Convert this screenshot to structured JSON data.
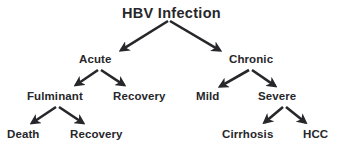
{
  "diagram": {
    "title": "HBV Infection",
    "type": "tree-flowchart",
    "colors": {
      "background": "#ffffff",
      "text": "#27272b",
      "arrow": "#27272b"
    },
    "nodes": [
      {
        "id": "root",
        "label": "HBV  Infection",
        "level": 0,
        "x": 122,
        "y": 6,
        "font_size": 14.5
      },
      {
        "id": "acute",
        "label": "Acute",
        "level": 1,
        "x": 79,
        "y": 54,
        "font_size": 11.5
      },
      {
        "id": "chronic",
        "label": "Chronic",
        "level": 1,
        "x": 229,
        "y": 54,
        "font_size": 11.5
      },
      {
        "id": "fulminant",
        "label": "Fulminant",
        "level": 2,
        "x": 27,
        "y": 91,
        "font_size": 11.5
      },
      {
        "id": "recovery-a",
        "label": "Recovery",
        "level": 2,
        "x": 113,
        "y": 91,
        "font_size": 11.5
      },
      {
        "id": "mild",
        "label": "Mild",
        "level": 2,
        "x": 196,
        "y": 91,
        "font_size": 11.5
      },
      {
        "id": "severe",
        "label": "Severe",
        "level": 2,
        "x": 258,
        "y": 91,
        "font_size": 11.5
      },
      {
        "id": "death",
        "label": "Death",
        "level": 3,
        "x": 7,
        "y": 129,
        "font_size": 11.5
      },
      {
        "id": "recovery-f",
        "label": "Recovery",
        "level": 3,
        "x": 70,
        "y": 129,
        "font_size": 11.5
      },
      {
        "id": "cirrhosis",
        "label": "Cirrhosis",
        "level": 3,
        "x": 222,
        "y": 129,
        "font_size": 11.5
      },
      {
        "id": "hcc",
        "label": "HCC",
        "level": 3,
        "x": 303,
        "y": 129,
        "font_size": 11.5
      }
    ],
    "edges": [
      {
        "from": "root",
        "to": "acute",
        "x1": 168,
        "y1": 21,
        "x2": 115,
        "y2": 54
      },
      {
        "from": "root",
        "to": "chronic",
        "x1": 170,
        "y1": 21,
        "x2": 226,
        "y2": 54
      },
      {
        "from": "acute",
        "to": "fulminant",
        "x1": 98,
        "y1": 70,
        "x2": 70,
        "y2": 89
      },
      {
        "from": "acute",
        "to": "recovery-a",
        "x1": 101,
        "y1": 70,
        "x2": 130,
        "y2": 89
      },
      {
        "from": "chronic",
        "to": "mild",
        "x1": 249,
        "y1": 70,
        "x2": 214,
        "y2": 90
      },
      {
        "from": "chronic",
        "to": "severe",
        "x1": 252,
        "y1": 70,
        "x2": 281,
        "y2": 90
      },
      {
        "from": "fulminant",
        "to": "death",
        "x1": 56,
        "y1": 107,
        "x2": 26,
        "y2": 127
      },
      {
        "from": "fulminant",
        "to": "recovery-f",
        "x1": 59,
        "y1": 107,
        "x2": 89,
        "y2": 127
      },
      {
        "from": "severe",
        "to": "cirrhosis",
        "x1": 283,
        "y1": 107,
        "x2": 259,
        "y2": 127
      },
      {
        "from": "severe",
        "to": "hcc",
        "x1": 286,
        "y1": 107,
        "x2": 311,
        "y2": 127
      }
    ]
  }
}
